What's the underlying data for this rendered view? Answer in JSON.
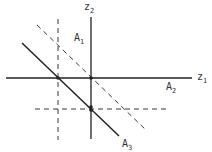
{
  "diagram": {
    "colors": {
      "ink": "#222222",
      "label": "#333333",
      "background": "#ffffff"
    },
    "axes": {
      "horizontal": {
        "label": "z",
        "subscript": "1",
        "x1": 6,
        "x2": 192,
        "y": 78
      },
      "vertical": {
        "label": "z",
        "subscript": "2",
        "x": 91,
        "y1": 17,
        "y2": 139
      }
    },
    "lines": [
      {
        "id": "A3",
        "style": "solid",
        "x1": 22,
        "y1": 43,
        "x2": 119,
        "y2": 136
      },
      {
        "id": "dashed-diagonal",
        "style": "dashed",
        "x1": 37,
        "y1": 25,
        "x2": 147,
        "y2": 131
      },
      {
        "id": "dashed-vertical",
        "style": "dashed",
        "x1": 58,
        "y1": 19,
        "x2": 58,
        "y2": 140
      },
      {
        "id": "dashed-horizontal",
        "style": "dashed",
        "x1": 35,
        "y1": 109,
        "x2": 170,
        "y2": 109
      }
    ],
    "points": [
      {
        "cx": 58,
        "cy": 78
      },
      {
        "cx": 91,
        "cy": 78
      },
      {
        "cx": 91,
        "cy": 107
      },
      {
        "cx": 91,
        "cy": 110
      }
    ],
    "labels": [
      {
        "id": "A1",
        "text": "A",
        "subscript": "1",
        "x": 74,
        "y": 41
      },
      {
        "id": "A2",
        "text": "A",
        "subscript": "2",
        "x": 166,
        "y": 90
      },
      {
        "id": "A3",
        "text": "A",
        "subscript": "3",
        "x": 122,
        "y": 147
      }
    ],
    "axis_labels": [
      {
        "id": "z1",
        "text": "z",
        "subscript": "1",
        "x": 197,
        "y": 80
      },
      {
        "id": "z2",
        "text": "z",
        "subscript": "2",
        "x": 84,
        "y": 10
      }
    ]
  }
}
